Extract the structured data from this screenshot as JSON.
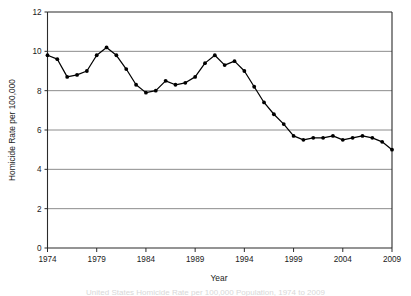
{
  "chart_data": {
    "type": "line",
    "title": "",
    "xlabel": "Year",
    "ylabel": "Homicide Rate per 100,000",
    "xlim": [
      1974,
      2009
    ],
    "ylim": [
      0,
      12
    ],
    "grid": true,
    "legend": "none",
    "xticks": [
      "1974",
      "1979",
      "1984",
      "1989",
      "1994",
      "1999",
      "2004",
      "2009"
    ],
    "yticks": [
      "0",
      "2",
      "4",
      "6",
      "8",
      "10",
      "12"
    ],
    "x": [
      1974,
      1975,
      1976,
      1977,
      1978,
      1979,
      1980,
      1981,
      1982,
      1983,
      1984,
      1985,
      1986,
      1987,
      1988,
      1989,
      1990,
      1991,
      1992,
      1993,
      1994,
      1995,
      1996,
      1997,
      1998,
      1999,
      2000,
      2001,
      2002,
      2003,
      2004,
      2005,
      2006,
      2007,
      2008,
      2009
    ],
    "values": [
      9.8,
      9.6,
      8.7,
      8.8,
      9.0,
      9.8,
      10.2,
      9.8,
      9.1,
      8.3,
      7.9,
      8.0,
      8.5,
      8.3,
      8.4,
      8.7,
      9.4,
      9.8,
      9.3,
      9.5,
      9.0,
      8.2,
      7.4,
      6.8,
      6.3,
      5.7,
      5.5,
      5.6,
      5.6,
      5.7,
      5.5,
      5.6,
      5.7,
      5.6,
      5.4,
      5.0
    ],
    "series_name": "Homicide Rate per 100,000"
  },
  "caption": {
    "text": "United States Homicide Rate per 100,000 Population, 1974 to 2009"
  },
  "axes": {
    "x_axis_title": "Year",
    "y_axis_title": "Homicide Rate per 100,000"
  }
}
